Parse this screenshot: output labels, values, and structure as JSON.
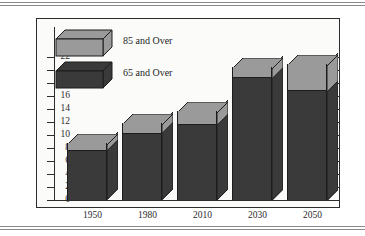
{
  "chart_data": {
    "type": "bar",
    "subtype": "stacked-3d-column",
    "title": "",
    "xlabel": "",
    "ylabel": "",
    "categories": [
      "1950",
      "1980",
      "2010",
      "2030",
      "2050"
    ],
    "series": [
      {
        "name": "65 and Over",
        "color": "#3a3a3a",
        "values": [
          7.5,
          10.2,
          11.5,
          18.7,
          16.7
        ]
      },
      {
        "name": "85 and Over",
        "color": "#9a9a9a",
        "values": [
          1.2,
          1.6,
          2.2,
          1.8,
          4.3
        ]
      }
    ],
    "totals": [
      8.7,
      11.8,
      13.7,
      20.5,
      21.0
    ],
    "ylim": [
      0,
      22
    ],
    "ytick_interval": 2,
    "yticks": [
      "0",
      "2",
      "4",
      "6",
      "8",
      "10",
      "12",
      "14",
      "16",
      "18",
      "20",
      "22"
    ],
    "grid": false,
    "right_axis_ticks": true,
    "right_axis_labeled": false,
    "legend_position": "top-left",
    "legend": [
      "85 and Over",
      "65 and Over"
    ]
  },
  "colors": {
    "dark": "#3a3a3a",
    "light": "#9a9a9a",
    "outline": "#1d1d1d",
    "axis": "#2c2c2c",
    "plot_background": "#fbfbfa",
    "page_background": "#ffffff",
    "rule": "#8a8a8a"
  },
  "legend": {
    "items": [
      {
        "label": "85 and Over",
        "swatch": "light"
      },
      {
        "label": "65 and Over",
        "swatch": "dark"
      }
    ]
  },
  "axis": {
    "y_labels": [
      "22",
      "20",
      "18",
      "16",
      "14",
      "12",
      "10",
      "8",
      "6",
      "4",
      "2",
      "0"
    ],
    "x_labels": [
      "1950",
      "1980",
      "2010",
      "2030",
      "2050"
    ]
  }
}
